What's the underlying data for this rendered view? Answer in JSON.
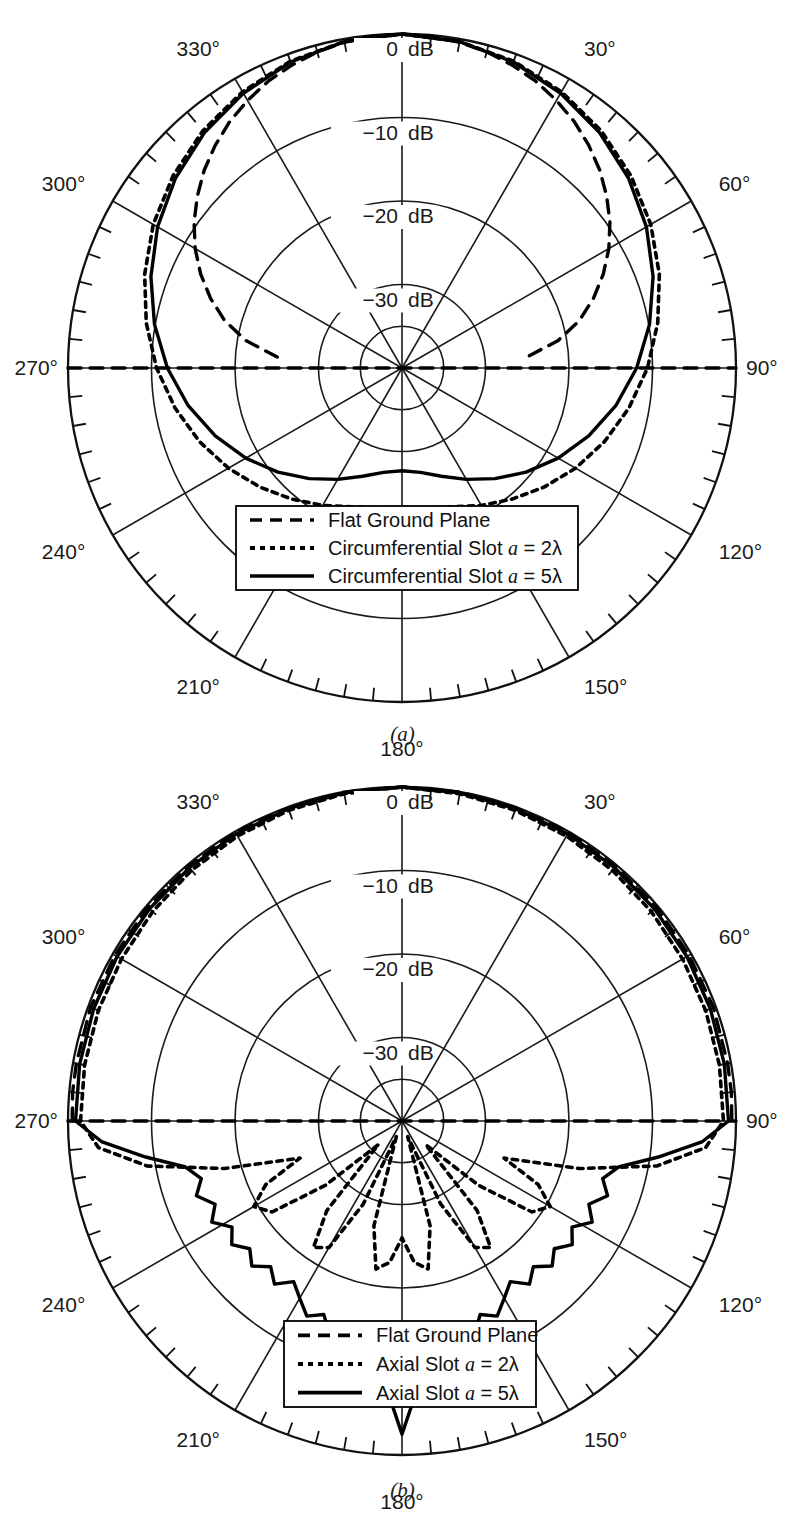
{
  "figure": {
    "caption_a": "(a)",
    "caption_b": "(b)"
  },
  "chart_data": [
    {
      "id": "chart-a",
      "type": "line",
      "projection": "polar",
      "title": "",
      "caption": "(a)",
      "rlabel_unit": "dB",
      "rlim": [
        -40,
        0
      ],
      "r_ticks": [
        0,
        -10,
        -20,
        -30
      ],
      "r_tick_labels": [
        "0 dB",
        "-10 dB",
        "-20 dB",
        "-30 dB"
      ],
      "theta_major_step": 30,
      "theta_minor_step": 5,
      "theta_tick_labels": [
        "0°",
        "30°",
        "60°",
        "90°",
        "120°",
        "150°",
        "180°",
        "210°",
        "240°",
        "270°",
        "300°",
        "330°"
      ],
      "theta_zero_location": "N",
      "grid": true,
      "legend_position": "lower-center",
      "series": [
        {
          "name": "Flat Ground Plane",
          "style": "dashed",
          "theta": [
            0,
            5,
            10,
            15,
            20,
            25,
            30,
            35,
            40,
            45,
            50,
            55,
            60,
            65,
            70,
            75,
            80,
            85,
            90,
            95,
            100,
            110,
            120,
            130,
            140,
            150,
            160,
            170,
            180,
            190,
            200,
            210,
            220,
            230,
            240,
            250,
            260,
            265,
            270,
            275,
            280,
            285,
            290,
            295,
            300,
            305,
            310,
            315,
            320,
            325,
            330,
            335,
            340,
            345,
            350,
            355,
            360
          ],
          "r": [
            0,
            -0.1,
            -0.4,
            -0.8,
            -1.4,
            -2.1,
            -3.0,
            -4.0,
            -5.2,
            -6.5,
            -8.0,
            -9.6,
            -11.4,
            -13.4,
            -15.6,
            -18.0,
            -21.0,
            -25.0,
            -40,
            -40,
            -40,
            -40,
            -40,
            -40,
            -40,
            -40,
            -40,
            -40,
            -40,
            -40,
            -40,
            -40,
            -40,
            -40,
            -40,
            -40,
            -40,
            -40,
            -40,
            -25.0,
            -21.0,
            -18.0,
            -15.6,
            -13.4,
            -11.4,
            -9.6,
            -8.0,
            -6.5,
            -5.2,
            -4.0,
            -3.0,
            -2.1,
            -1.4,
            -0.8,
            -0.4,
            -0.1,
            0
          ]
        },
        {
          "name": "Circumferential Slot a = 2λ",
          "style": "dotted",
          "theta": [
            0,
            10,
            20,
            30,
            40,
            50,
            60,
            70,
            80,
            90,
            100,
            110,
            120,
            130,
            140,
            150,
            160,
            170,
            180,
            190,
            200,
            210,
            220,
            230,
            240,
            250,
            260,
            270,
            280,
            290,
            300,
            310,
            320,
            330,
            340,
            350,
            360
          ],
          "r": [
            0,
            -0.3,
            -0.9,
            -1.8,
            -2.9,
            -4.2,
            -5.6,
            -7.2,
            -8.9,
            -10.6,
            -12.4,
            -14.2,
            -16.0,
            -17.8,
            -19.5,
            -21.0,
            -22.3,
            -23.0,
            -23.3,
            -23.0,
            -22.3,
            -21.0,
            -19.5,
            -17.8,
            -16.0,
            -14.2,
            -12.4,
            -10.6,
            -8.9,
            -7.2,
            -5.6,
            -4.2,
            -2.9,
            -1.8,
            -0.9,
            -0.3,
            0
          ]
        },
        {
          "name": "Circumferential Slot a = 5λ",
          "style": "solid",
          "theta": [
            0,
            10,
            20,
            30,
            40,
            50,
            60,
            70,
            80,
            90,
            100,
            110,
            120,
            130,
            140,
            150,
            160,
            170,
            180,
            190,
            200,
            210,
            220,
            230,
            240,
            250,
            260,
            270,
            280,
            290,
            300,
            310,
            320,
            330,
            340,
            350,
            360
          ],
          "r": [
            0,
            -0.3,
            -1.0,
            -2.0,
            -3.2,
            -4.6,
            -6.2,
            -8.0,
            -9.9,
            -11.9,
            -14.0,
            -16.2,
            -18.4,
            -20.6,
            -22.7,
            -24.6,
            -26.2,
            -27.3,
            -27.7,
            -27.3,
            -26.2,
            -24.6,
            -22.7,
            -20.6,
            -18.4,
            -16.2,
            -14.0,
            -11.9,
            -9.9,
            -8.0,
            -6.2,
            -4.6,
            -3.2,
            -2.0,
            -1.0,
            -0.3,
            0
          ]
        }
      ],
      "legend": [
        {
          "label": "Flat Ground Plane",
          "style": "dashed"
        },
        {
          "label": "Circumferential Slot ",
          "italic": "a",
          "tail": " = 2λ",
          "style": "dotted"
        },
        {
          "label": "Circumferential Slot ",
          "italic": "a",
          "tail": " = 5λ",
          "style": "solid"
        }
      ]
    },
    {
      "id": "chart-b",
      "type": "line",
      "projection": "polar",
      "title": "",
      "caption": "(b)",
      "rlabel_unit": "dB",
      "rlim": [
        -40,
        0
      ],
      "r_ticks": [
        0,
        -10,
        -20,
        -30
      ],
      "r_tick_labels": [
        "0 dB",
        "-10 dB",
        "-20 dB",
        "-30 dB"
      ],
      "theta_major_step": 30,
      "theta_minor_step": 5,
      "theta_tick_labels": [
        "0°",
        "30°",
        "60°",
        "90°",
        "120°",
        "150°",
        "180°",
        "210°",
        "240°",
        "270°",
        "300°",
        "330°"
      ],
      "theta_zero_location": "N",
      "grid": true,
      "legend_position": "lower-center",
      "series": [
        {
          "name": "Flat Ground Plane",
          "style": "dashed",
          "theta": [
            0,
            10,
            20,
            30,
            40,
            50,
            60,
            70,
            80,
            85,
            90,
            95,
            100,
            110,
            120,
            130,
            140,
            150,
            160,
            170,
            180,
            190,
            200,
            210,
            220,
            230,
            240,
            250,
            260,
            265,
            270,
            275,
            280,
            290,
            300,
            310,
            320,
            330,
            340,
            350,
            360
          ],
          "r": [
            0,
            0,
            -0.1,
            -0.1,
            -0.2,
            -0.2,
            -0.3,
            -0.3,
            -0.4,
            -0.4,
            -0.5,
            -40,
            -40,
            -40,
            -40,
            -40,
            -40,
            -40,
            -40,
            -40,
            -40,
            -40,
            -40,
            -40,
            -40,
            -40,
            -40,
            -40,
            -40,
            -40,
            -0.5,
            -0.4,
            -0.4,
            -0.3,
            -0.3,
            -0.2,
            -0.2,
            -0.1,
            -0.1,
            0,
            0
          ]
        },
        {
          "name": "Axial Slot a = 2λ",
          "style": "dotted",
          "theta": [
            0,
            10,
            20,
            30,
            40,
            50,
            60,
            70,
            80,
            90,
            95,
            100,
            105,
            110,
            115,
            120,
            125,
            130,
            135,
            140,
            145,
            150,
            155,
            160,
            165,
            170,
            175,
            180,
            185,
            190,
            195,
            200,
            205,
            210,
            215,
            220,
            225,
            230,
            235,
            240,
            245,
            250,
            255,
            260,
            265,
            270,
            280,
            290,
            300,
            310,
            320,
            330,
            340,
            350,
            360
          ],
          "r": [
            0,
            -0.2,
            -0.4,
            -0.6,
            -0.8,
            -1.0,
            -1.2,
            -1.3,
            -1.4,
            -1.5,
            -3.5,
            -9.0,
            -18.0,
            -27.0,
            -22.0,
            -19.5,
            -21.0,
            -28.0,
            -36.0,
            -26.0,
            -21.5,
            -22.5,
            -29.0,
            -38.0,
            -27.0,
            -22.0,
            -23.0,
            -26.0,
            -23.0,
            -22.0,
            -27.0,
            -38.0,
            -29.0,
            -22.5,
            -21.5,
            -26.0,
            -36.0,
            -28.0,
            -21.0,
            -19.5,
            -22.0,
            -27.0,
            -18.0,
            -9.0,
            -3.5,
            -1.5,
            -1.4,
            -1.3,
            -1.2,
            -1.0,
            -0.8,
            -0.6,
            -0.4,
            -0.2,
            0
          ]
        },
        {
          "name": "Axial Slot a = 5λ",
          "style": "solid",
          "theta": [
            0,
            10,
            20,
            30,
            40,
            50,
            60,
            70,
            80,
            90,
            94,
            98,
            102,
            106,
            110,
            114,
            118,
            122,
            126,
            130,
            134,
            138,
            142,
            146,
            150,
            154,
            158,
            162,
            164,
            166,
            168,
            170,
            172,
            174,
            176,
            178,
            180,
            182,
            184,
            186,
            188,
            190,
            192,
            194,
            196,
            198,
            202,
            206,
            210,
            214,
            218,
            222,
            226,
            230,
            234,
            238,
            242,
            246,
            250,
            254,
            258,
            262,
            266,
            270,
            280,
            290,
            300,
            310,
            320,
            330,
            340,
            350,
            360
          ],
          "r": [
            0,
            -0.1,
            -0.2,
            -0.3,
            -0.4,
            -0.5,
            -0.6,
            -0.7,
            -0.8,
            -0.9,
            -4.0,
            -9.0,
            -13.5,
            -15.0,
            -13.8,
            -15.5,
            -14.2,
            -16.0,
            -14.8,
            -16.2,
            -15.0,
            -16.5,
            -15.2,
            -16.8,
            -15.5,
            -14.0,
            -15.0,
            -12.5,
            -13.5,
            -10.5,
            -12.0,
            -9.0,
            -10.5,
            -7.5,
            -9.0,
            -6.0,
            -2.5,
            -6.0,
            -9.0,
            -7.5,
            -10.5,
            -9.0,
            -12.0,
            -10.5,
            -13.5,
            -12.5,
            -15.0,
            -14.0,
            -15.5,
            -16.8,
            -15.2,
            -16.5,
            -15.0,
            -16.2,
            -14.8,
            -16.0,
            -14.2,
            -15.5,
            -13.8,
            -15.0,
            -13.5,
            -9.0,
            -4.0,
            -0.9,
            -0.8,
            -0.7,
            -0.6,
            -0.5,
            -0.4,
            -0.3,
            -0.2,
            -0.1,
            0
          ]
        }
      ],
      "legend": [
        {
          "label": "Flat Ground Plane",
          "style": "dashed"
        },
        {
          "label": "Axial Slot ",
          "italic": "a",
          "tail": " = 2λ",
          "style": "dotted"
        },
        {
          "label": "Axial Slot ",
          "italic": "a",
          "tail": " = 5λ",
          "style": "solid"
        }
      ]
    }
  ]
}
